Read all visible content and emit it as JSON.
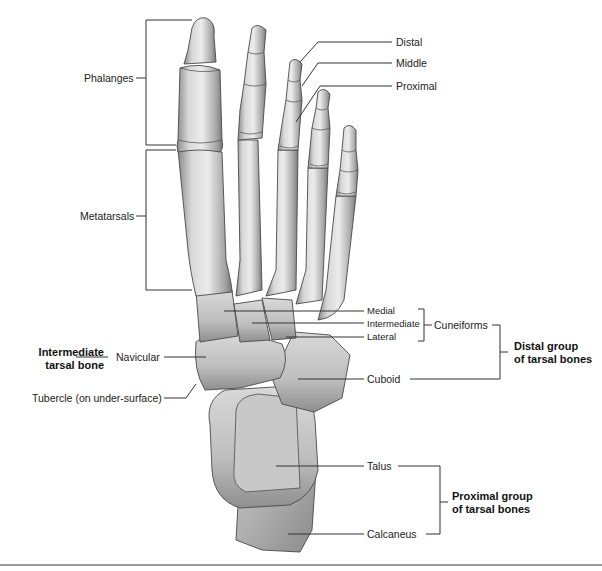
{
  "figure": {
    "colors": {
      "bone_light": "#e6e6e6",
      "bone_mid": "#bdbdbd",
      "bone_dark": "#7c7c7c",
      "outline": "#4a4a4a",
      "leader": "#333333",
      "rule": "#9a9a9a"
    }
  },
  "labels": {
    "phalanges": "Phalanges",
    "metatarsals": "Metatarsals",
    "distal": "Distal",
    "middle": "Middle",
    "proximal": "Proximal",
    "medial": "Medial",
    "intermediate": "Intermediate",
    "lateral": "Lateral",
    "cuneiforms": "Cuneiforms",
    "navicular": "Navicular",
    "tubercle": "Tubercle (on under-surface)",
    "cuboid": "Cuboid",
    "talus": "Talus",
    "calcaneus": "Calcaneus"
  },
  "groups": {
    "intermediate_line1": "Intermediate",
    "intermediate_line2": "tarsal bone",
    "distal_line1": "Distal group",
    "distal_line2": "of tarsal bones",
    "proximal_line1": "Proximal group",
    "proximal_line2": "of tarsal bones"
  }
}
